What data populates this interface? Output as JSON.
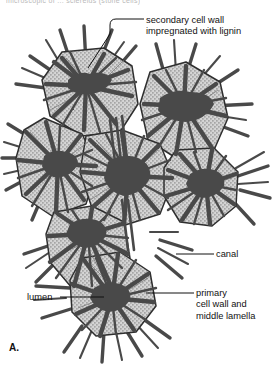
{
  "figure": {
    "id": "A.",
    "top_cut_text": "microscopic of ... sclereids (stone cells)"
  },
  "labels": {
    "secondary_wall": {
      "line1": "secondary cell wall",
      "line2": "impregnated with lignin"
    },
    "canal": "canal",
    "lumen": "lumen",
    "primary_wall": {
      "line1": "primary",
      "line2": "cell wall and",
      "line3": "middle lamella"
    }
  },
  "colors": {
    "stipple_fill": "#c9c9c9",
    "lumen_dark": "#4a4a4a",
    "outline": "#2a2a2a",
    "label_text": "#111111",
    "leader_line": "#1a1a1a",
    "background": "#ffffff"
  },
  "diagram_data": {
    "type": "botanical-cell-cluster",
    "cell_count": 7,
    "cells": [
      {
        "name": "cell-top-left",
        "cx": 82,
        "cy": 86,
        "r": 44
      },
      {
        "name": "cell-top-right",
        "cx": 178,
        "cy": 105,
        "r": 44
      },
      {
        "name": "cell-mid-left",
        "cx": 58,
        "cy": 160,
        "r": 42
      },
      {
        "name": "cell-center",
        "cx": 128,
        "cy": 173,
        "r": 46
      },
      {
        "name": "cell-mid-right",
        "cx": 205,
        "cy": 180,
        "r": 40
      },
      {
        "name": "cell-low-left",
        "cx": 88,
        "cy": 228,
        "r": 42
      },
      {
        "name": "cell-bottom",
        "cx": 112,
        "cy": 294,
        "r": 44
      }
    ]
  }
}
